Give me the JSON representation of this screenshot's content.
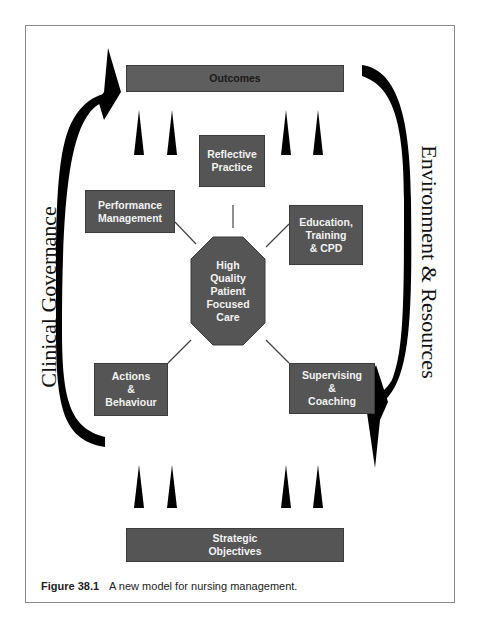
{
  "diagram": {
    "top_box": {
      "label": "Outcomes"
    },
    "bottom_box": {
      "label": "Strategic\nObjectives"
    },
    "center": {
      "label": "High\nQuality\nPatient\nFocused\nCare",
      "shape": "octagon"
    },
    "nodes": [
      {
        "id": "reflective-practice",
        "label": "Reflective\nPractice"
      },
      {
        "id": "performance-management",
        "label": "Performance\nManagement"
      },
      {
        "id": "education-training-cpd",
        "label": "Education,\nTraining\n& CPD"
      },
      {
        "id": "actions-behaviour",
        "label": "Actions\n&\nBehaviour"
      },
      {
        "id": "supervising-coaching",
        "label": "Supervising\n&\nCoaching"
      }
    ],
    "left_cycle_label": "Clinical Governance",
    "right_cycle_label": "Environment & Resources",
    "colors": {
      "box_fill": "#555555",
      "box_text": "#f2f2f2",
      "outcomes_text": "#1a1a1a",
      "arrow": "#000000",
      "frame": "#8a8a8a"
    }
  },
  "caption": {
    "figure_number": "Figure 38.1",
    "text": "A new model for nursing management."
  }
}
